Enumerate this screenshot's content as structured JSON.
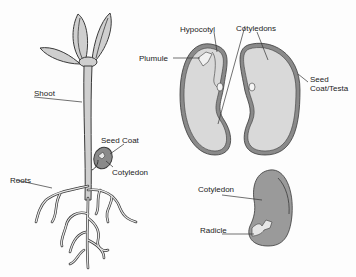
{
  "diagram": {
    "colors": {
      "outline": "#3a3a3a",
      "seed_coat": "#8a8a8a",
      "cotyledon_fill": "#d9d9d9",
      "dark_cotyledon": "#9a9a9a",
      "plant_fill": "#cfcfcf",
      "background": "#fdfdfd"
    },
    "seedling": {
      "labels": {
        "shoot": "Shoot",
        "seed_coat": "Seed Coat",
        "cotyledon": "Cotyledon",
        "roots": "Roots"
      }
    },
    "open_seed": {
      "labels": {
        "hypocotyl": "Hypocotyl",
        "cotyledons": "Cotyledons",
        "plumule": "Plumule",
        "seed_coat_line1": "Seed",
        "seed_coat_line2": "Coat/Testa"
      }
    },
    "single_cotyledon": {
      "labels": {
        "cotyledon": "Cotyledon",
        "radicle": "Radicle"
      }
    }
  }
}
